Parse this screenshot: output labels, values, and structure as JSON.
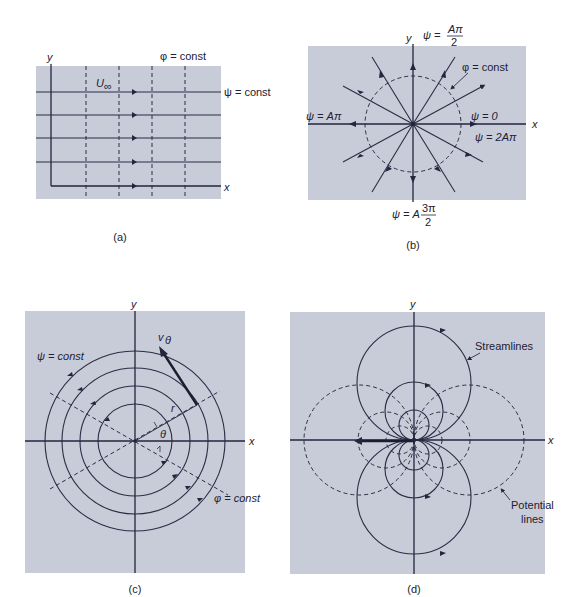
{
  "figure": {
    "panels": [
      {
        "id": "a",
        "caption": "(a)",
        "title": "Uniform flow",
        "labels": {
          "y_axis": "y",
          "x_axis": "x",
          "velocity": "U",
          "velocity_sub": "∞",
          "potential": "φ = const",
          "stream": "ψ = const"
        },
        "streamline_count": 5,
        "potential_line_count": 4
      },
      {
        "id": "b",
        "caption": "(b)",
        "title": "Line source",
        "labels": {
          "y_axis": "y",
          "x_axis": "x",
          "top": "ψ = Aπ/2",
          "top_prefix": "ψ =",
          "top_num": "Aπ",
          "top_den": "2",
          "left": "ψ = Aπ",
          "right_upper": "ψ = 0",
          "right_lower": "ψ = 2Aπ",
          "bottom": "ψ = A 3π/2",
          "bottom_prefix": "ψ = A",
          "bottom_num": "3π",
          "bottom_den": "2",
          "potential": "φ = const"
        },
        "radial_line_count": 12
      },
      {
        "id": "c",
        "caption": "(c)",
        "title": "Line vortex",
        "labels": {
          "y_axis": "y",
          "x_axis": "x",
          "stream": "ψ = const",
          "potential": "φ = const",
          "velocity": "v",
          "velocity_sub": "θ",
          "radius": "r",
          "angle": "θ"
        },
        "circle_count": 4
      },
      {
        "id": "d",
        "caption": "(d)",
        "title": "Doublet",
        "labels": {
          "y_axis": "y",
          "x_axis": "x",
          "stream": "Streamlines",
          "potential_1": "Potential",
          "potential_2": "lines"
        }
      }
    ]
  }
}
